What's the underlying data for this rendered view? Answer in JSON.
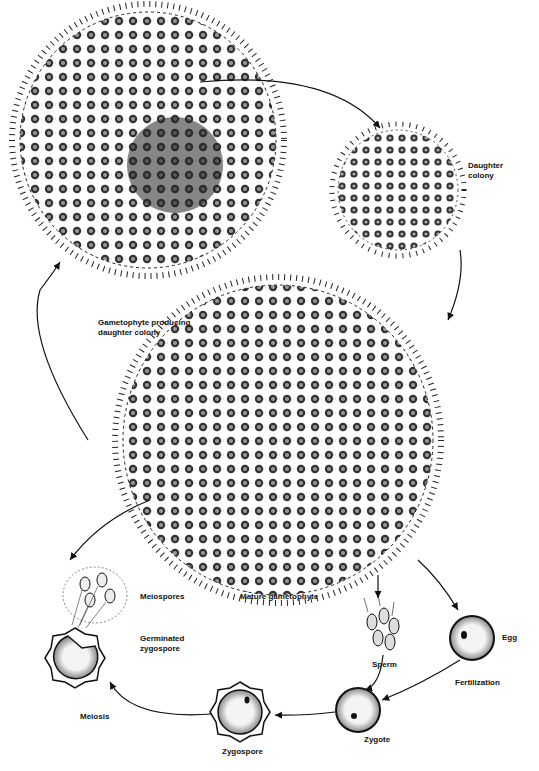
{
  "diagram": {
    "labels": {
      "daughter_colony": "Daughter\ncolony",
      "gametophyte_producing": "Gametophyte producing\ndaughter colony",
      "mature_gametophyte": "Mature gametophyte",
      "meiospores": "Meiospores",
      "germinated_zygospore": "Germinated\nzygospore",
      "sperm": "Sperm",
      "egg": "Egg",
      "fertilization": "Fertilization",
      "zygote": "Zygote",
      "zygospore": "Zygospore",
      "meiosis": "Meiosis"
    },
    "stages": [
      {
        "id": "gametophyte-producing-daughter-colony",
        "cx": 148,
        "cy": 140,
        "r": 130
      },
      {
        "id": "daughter-colony",
        "cx": 398,
        "cy": 190,
        "r": 65
      },
      {
        "id": "mature-gametophyte",
        "cx": 278,
        "cy": 440,
        "r": 160
      },
      {
        "id": "sperm-cluster",
        "cx": 378,
        "cy": 630
      },
      {
        "id": "egg",
        "cx": 472,
        "cy": 638,
        "r": 22
      },
      {
        "id": "zygote",
        "cx": 358,
        "cy": 710,
        "r": 22
      },
      {
        "id": "zygospore",
        "cx": 240,
        "cy": 712,
        "r": 26
      },
      {
        "id": "germinated-zygospore",
        "cx": 75,
        "cy": 655,
        "r": 25
      },
      {
        "id": "meiospores",
        "cx": 95,
        "cy": 590
      }
    ],
    "colors": {
      "ink": "#111111",
      "dots": "#222222",
      "background": "#ffffff"
    }
  }
}
